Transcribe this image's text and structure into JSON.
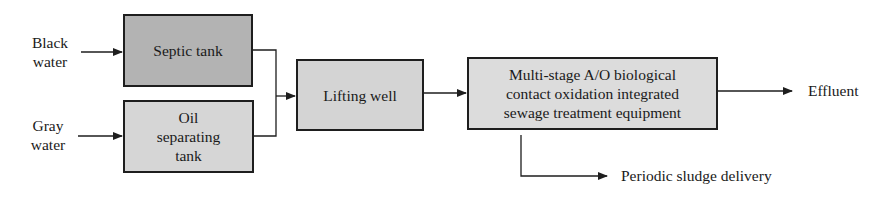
{
  "diagram": {
    "inputs": [
      {
        "id": "black-water",
        "label_line1": "Black",
        "label_line2": "water"
      },
      {
        "id": "gray-water",
        "label_line1": "Gray",
        "label_line2": "water"
      }
    ],
    "nodes": [
      {
        "id": "septic-tank",
        "label": "Septic tank",
        "fill": "#b3b3b3"
      },
      {
        "id": "oil-separating-tank",
        "label_line1": "Oil",
        "label_line2": "separating",
        "label_line3": "tank",
        "fill": "#d6d6d6"
      },
      {
        "id": "lifting-well",
        "label": "Lifting well",
        "fill": "#d4d4d4"
      },
      {
        "id": "treatment-equipment",
        "label_line1": "Multi-stage A/O biological",
        "label_line2": "contact oxidation integrated",
        "label_line3": "sewage treatment equipment",
        "fill": "#dcdcdc"
      }
    ],
    "outputs": [
      {
        "id": "effluent",
        "label": "Effluent"
      },
      {
        "id": "sludge",
        "label": "Periodic sludge delivery"
      }
    ],
    "edges": [
      [
        "black-water",
        "septic-tank"
      ],
      [
        "gray-water",
        "oil-separating-tank"
      ],
      [
        "septic-tank",
        "lifting-well"
      ],
      [
        "oil-separating-tank",
        "lifting-well"
      ],
      [
        "lifting-well",
        "treatment-equipment"
      ],
      [
        "treatment-equipment",
        "effluent"
      ],
      [
        "treatment-equipment",
        "sludge"
      ]
    ]
  }
}
